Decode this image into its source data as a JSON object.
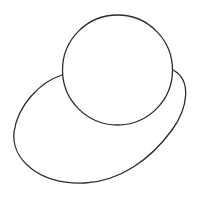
{
  "canvas": {
    "width": 199,
    "height": 199,
    "background": "#ffffff"
  },
  "stroke": {
    "color": "#2b2b2b",
    "width": 1.3
  },
  "shapes": {
    "circle": {
      "cx": 117.5,
      "cy": 70,
      "r": 55
    },
    "outer_blob": {
      "path": "M 62 75 C 40 82, 18 105, 14 132 C 11 160, 40 185, 85 183 C 120 181, 150 160, 172 130 C 188 108, 192 80, 173 70"
    }
  }
}
